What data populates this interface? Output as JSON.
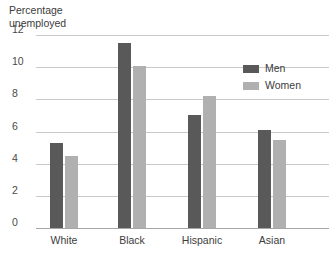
{
  "chart_data": {
    "type": "bar",
    "title": "Percentage unemployed",
    "title_line1": "Percentage",
    "title_line2": "unemployed",
    "xlabel": "",
    "ylabel": "Percentage unemployed",
    "categories": [
      "White",
      "Black",
      "Hispanic",
      "Asian"
    ],
    "series": [
      {
        "name": "Men",
        "values": [
          5.3,
          11.5,
          7.0,
          6.1
        ],
        "color": "#595959"
      },
      {
        "name": "Women",
        "values": [
          4.5,
          10.1,
          8.2,
          5.5
        ],
        "color": "#b0b0b0"
      }
    ],
    "ylim": [
      0,
      12
    ],
    "yticks": [
      0,
      2,
      4,
      6,
      8,
      10,
      12
    ],
    "ytick_labels": [
      "0",
      "2",
      "4",
      "6",
      "8",
      "10",
      "12"
    ],
    "grid": true,
    "legend_position": "top-right",
    "legend": [
      "Men",
      "Women"
    ]
  },
  "colors": {
    "men": "#595959",
    "women": "#b0b0b0",
    "gridline": "#c9c9c9",
    "baseline": "#a8a8a8",
    "text": "#3c3c3c",
    "background": "#ffffff"
  }
}
